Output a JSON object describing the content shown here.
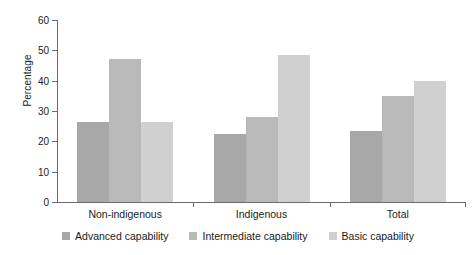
{
  "chart_data": {
    "type": "bar",
    "title": "",
    "xlabel": "",
    "ylabel": "Percentage",
    "ylim": [
      0,
      60
    ],
    "yticks": [
      0,
      10,
      20,
      30,
      40,
      50,
      60
    ],
    "grid": false,
    "legend_position": "bottom",
    "categories": [
      "Non-indigenous",
      "Indigenous",
      "Total"
    ],
    "series": [
      {
        "name": "Advanced capability",
        "color": "#a8a8a8",
        "values": [
          26.5,
          22.5,
          23.5
        ]
      },
      {
        "name": "Intermediate capability",
        "color": "#b9b9b9",
        "values": [
          47.0,
          28.0,
          35.0
        ]
      },
      {
        "name": "Basic capability",
        "color": "#d0d0d0",
        "values": [
          26.5,
          48.5,
          40.0
        ]
      }
    ]
  },
  "axis": {
    "tick_labels": [
      "60",
      "50",
      "40",
      "30",
      "20",
      "10",
      "0"
    ],
    "y_title": "Percentage"
  },
  "legend": {
    "items": [
      {
        "label": "Advanced capability",
        "color": "#a8a8a8"
      },
      {
        "label": "Intermediate capability",
        "color": "#b9b9b9"
      },
      {
        "label": "Basic capability",
        "color": "#d0d0d0"
      }
    ]
  },
  "colors": {
    "axis": "#6b6b6b",
    "text": "#1a1a1a",
    "background": "#ffffff"
  }
}
